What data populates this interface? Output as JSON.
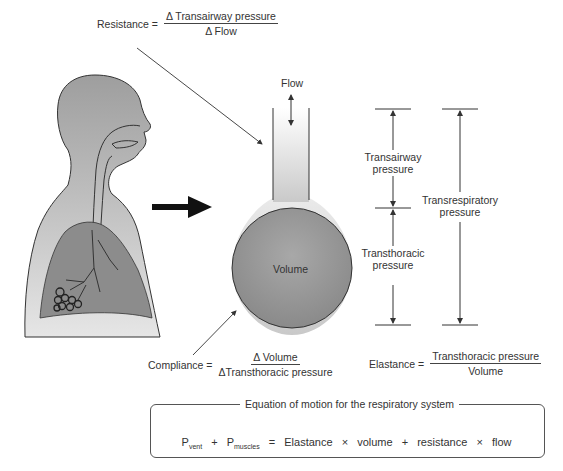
{
  "resistance": {
    "label": "Resistance =",
    "numerator": "Δ Transairway pressure",
    "denominator": "Δ Flow"
  },
  "compliance": {
    "label": "Compliance =",
    "numerator": "Δ Volume",
    "denominator": "ΔTransthoracic pressure"
  },
  "elastance": {
    "label": "Elastance =",
    "numerator": "Transthoracic pressure",
    "denominator": "Volume"
  },
  "model": {
    "flow_label": "Flow",
    "volume_label": "Volume"
  },
  "pressures": {
    "transairway": [
      "Transairway",
      "pressure"
    ],
    "transthoracic": [
      "Transthoracic",
      "pressure"
    ],
    "transrespiratory": [
      "Transrespiratory",
      "pressure"
    ]
  },
  "equation": {
    "title": "Equation of motion for the respiratory system",
    "p1": "P",
    "p1_sub": "vent",
    "plus1": "+",
    "p2": "P",
    "p2_sub": "muscles",
    "equals": "=",
    "term1": "Elastance",
    "times1": "×",
    "term2": "volume",
    "plus2": "+",
    "term3": "resistance",
    "times2": "×",
    "term4": "flow"
  },
  "colors": {
    "body_fill": "#b5b5b5",
    "lung_fill": "#8f8f8f",
    "outline": "#333333"
  }
}
